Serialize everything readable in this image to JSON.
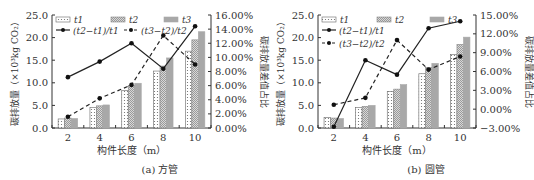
{
  "chart_data": [
    {
      "type": "bar+line",
      "caption": "(a) 方管",
      "xlabel": "构件长度（m）",
      "ylabel": "碳排放量（×10³kg CO₂）",
      "y2label": "碳排放量差值占比",
      "categories": [
        "2",
        "4",
        "6",
        "8",
        "10"
      ],
      "ylim": [
        0,
        25
      ],
      "yticks": [
        "0.0",
        "5.0",
        "10.0",
        "15.0",
        "20.0",
        "25.0"
      ],
      "y2lim": [
        0,
        16
      ],
      "y2ticks": [
        "0.00%",
        "2.00%",
        "4.00%",
        "6.00%",
        "8.00%",
        "10.00%",
        "12.00%",
        "14.00%",
        "16.00%"
      ],
      "series": [
        {
          "name": "t1",
          "kind": "bar",
          "values": [
            2.0,
            4.5,
            8.3,
            12.6,
            17.0
          ]
        },
        {
          "name": "t2",
          "kind": "bar",
          "values": [
            2.2,
            4.9,
            9.4,
            13.7,
            19.5
          ]
        },
        {
          "name": "t3",
          "kind": "bar",
          "values": [
            2.1,
            5.1,
            9.9,
            15.5,
            21.3
          ]
        },
        {
          "name": "(t2−t1)/t1",
          "kind": "line-solid",
          "axis": "y2",
          "values": [
            7.2,
            9.4,
            12.0,
            8.4,
            14.4
          ]
        },
        {
          "name": "(t3−t2)/t2",
          "kind": "line-dashed",
          "axis": "y2",
          "values": [
            1.6,
            4.2,
            6.1,
            13.1,
            9.0
          ]
        }
      ],
      "legend": [
        "t1",
        "t2",
        "t3",
        "(t2−t1)/t1",
        "(t3−t2)/t2"
      ]
    },
    {
      "type": "bar+line",
      "caption": "(b) 圆管",
      "xlabel": "构件长度（m）",
      "ylabel": "碳排放量（×10³kg CO₂）",
      "y2label": "碳排放量差值占比",
      "categories": [
        "2",
        "4",
        "6",
        "8",
        "10"
      ],
      "ylim": [
        0,
        25
      ],
      "yticks": [
        "0.0",
        "5.0",
        "10.0",
        "15.0",
        "20.0",
        "25.0"
      ],
      "y2lim": [
        -3,
        15
      ],
      "y2ticks": [
        "−3.00%",
        "0.00%",
        "3.00%",
        "6.00%",
        "9.00%",
        "12.00%",
        "15.00%"
      ],
      "series": [
        {
          "name": "t1",
          "kind": "bar",
          "values": [
            2.3,
            4.5,
            8.1,
            12.0,
            16.3
          ]
        },
        {
          "name": "t2",
          "kind": "bar",
          "values": [
            2.2,
            4.8,
            8.6,
            13.4,
            18.5
          ]
        },
        {
          "name": "t3",
          "kind": "bar",
          "values": [
            2.1,
            5.0,
            9.6,
            14.3,
            20.1
          ]
        },
        {
          "name": "(t2−t1)/t1",
          "kind": "line-solid",
          "axis": "y2",
          "values": [
            -2.8,
            7.8,
            5.5,
            12.9,
            14.0
          ]
        },
        {
          "name": "(t3−t2)/t2",
          "kind": "line-dashed",
          "axis": "y2",
          "values": [
            0.7,
            1.8,
            11.0,
            6.3,
            8.4
          ]
        }
      ],
      "legend": [
        "t1",
        "t2",
        "t3",
        "(t2−t1)/t1",
        "(t3−t2)/t2"
      ]
    }
  ]
}
